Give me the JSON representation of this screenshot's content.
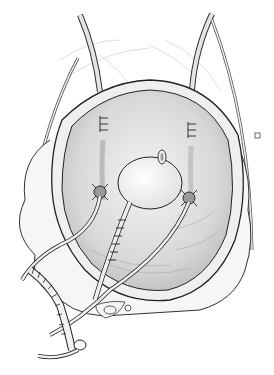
{
  "image": {
    "kind": "surgical line illustration",
    "subject": "opened bladder with ureteral stents and sutured conduit",
    "colors": {
      "background": "#ffffff",
      "outline": "#2a2a2a",
      "fill_light": "#eeeeee",
      "fill_mid": "#d6d6d6",
      "fill_dark": "#b8b8b8",
      "tube": "#e8e8e8"
    }
  }
}
